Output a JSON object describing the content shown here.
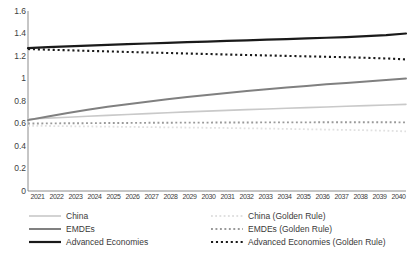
{
  "chart_data": {
    "type": "line",
    "title": "",
    "xlabel": "",
    "ylabel": "",
    "grid": false,
    "legend_position": "bottom",
    "ylim": [
      0,
      1.6
    ],
    "yticks": [
      "0",
      "0.2",
      "0.4",
      "0.6",
      "0.8",
      "1",
      "1.2",
      "1.4",
      "1.6"
    ],
    "ytick_values": [
      0,
      0.2,
      0.4,
      0.6,
      0.8,
      1.0,
      1.2,
      1.4,
      1.6
    ],
    "categories": [
      "2021",
      "2022",
      "2023",
      "2024",
      "2025",
      "2026",
      "2027",
      "2028",
      "2029",
      "2030",
      "2031",
      "2032",
      "2033",
      "2034",
      "2035",
      "2036",
      "2037",
      "2038",
      "2039",
      "2040"
    ],
    "series": [
      {
        "name": "China",
        "style": "solid",
        "color": "#c9c9c9",
        "width": 1.6,
        "values": [
          0.64,
          0.648,
          0.656,
          0.664,
          0.672,
          0.68,
          0.688,
          0.696,
          0.703,
          0.71,
          0.717,
          0.723,
          0.729,
          0.735,
          0.741,
          0.747,
          0.753,
          0.759,
          0.765,
          0.77
        ]
      },
      {
        "name": "EMDEs",
        "style": "solid",
        "color": "#808080",
        "width": 2.0,
        "values": [
          0.63,
          0.663,
          0.694,
          0.722,
          0.748,
          0.772,
          0.794,
          0.815,
          0.835,
          0.854,
          0.872,
          0.889,
          0.905,
          0.92,
          0.934,
          0.948,
          0.961,
          0.974,
          0.987,
          1.0
        ]
      },
      {
        "name": "Advanced Economies",
        "style": "solid",
        "color": "#1a1a1a",
        "width": 2.2,
        "values": [
          1.27,
          1.278,
          1.285,
          1.292,
          1.299,
          1.305,
          1.311,
          1.317,
          1.323,
          1.328,
          1.334,
          1.339,
          1.345,
          1.35,
          1.356,
          1.362,
          1.368,
          1.376,
          1.386,
          1.4
        ]
      },
      {
        "name": "China (Golden Rule)",
        "style": "dotted",
        "color": "#e0e0e0",
        "width": 1.8,
        "values": [
          0.58,
          0.578,
          0.576,
          0.574,
          0.572,
          0.57,
          0.568,
          0.566,
          0.564,
          0.562,
          0.56,
          0.557,
          0.555,
          0.552,
          0.549,
          0.546,
          0.543,
          0.54,
          0.536,
          0.53
        ]
      },
      {
        "name": "EMDEs (Golden Rule)",
        "style": "dotted",
        "color": "#9a9a9a",
        "width": 1.9,
        "values": [
          0.6,
          0.601,
          0.602,
          0.603,
          0.604,
          0.605,
          0.606,
          0.607,
          0.608,
          0.608,
          0.609,
          0.609,
          0.61,
          0.61,
          0.61,
          0.611,
          0.611,
          0.611,
          0.611,
          0.61
        ]
      },
      {
        "name": "Advanced Economies (Golden Rule)",
        "style": "dotted",
        "color": "#1a1a1a",
        "width": 2.1,
        "values": [
          1.262,
          1.256,
          1.251,
          1.246,
          1.241,
          1.236,
          1.231,
          1.227,
          1.222,
          1.218,
          1.213,
          1.209,
          1.205,
          1.201,
          1.197,
          1.193,
          1.189,
          1.184,
          1.178,
          1.17
        ]
      }
    ]
  },
  "legend": {
    "columns": [
      {
        "items": [
          {
            "label": "China",
            "series_index": 0
          },
          {
            "label": "EMDEs",
            "series_index": 1
          },
          {
            "label": "Advanced Economies",
            "series_index": 2
          }
        ]
      },
      {
        "items": [
          {
            "label": "China (Golden Rule)",
            "series_index": 3
          },
          {
            "label": "EMDEs (Golden Rule)",
            "series_index": 4
          },
          {
            "label": "Advanced Economies (Golden Rule)",
            "series_index": 5
          }
        ]
      }
    ]
  },
  "axis": {
    "axis_color": "#6e6e6e"
  }
}
